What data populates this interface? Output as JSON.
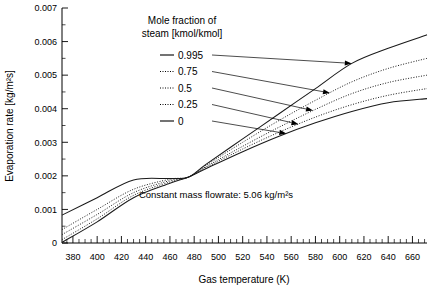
{
  "chart_data": {
    "type": "line",
    "title": "",
    "xlabel": "Gas temperature (K)",
    "ylabel": "Evaporation rate [kg/m²s]",
    "xlim": [
      371,
      672
    ],
    "ylim": [
      0,
      0.007
    ],
    "grid": false,
    "legend_position": "top-center-inside",
    "legend_title_line1": "Mole fraction of",
    "legend_title_line2": "steam [kmol/kmol]",
    "annotation": "Constant mass flowrate: 5.06 kg/m²s",
    "xticks": [
      380,
      400,
      420,
      440,
      460,
      480,
      500,
      520,
      540,
      560,
      580,
      600,
      620,
      640,
      660
    ],
    "xtick_labels": [
      "380",
      "400",
      "420",
      "440",
      "460",
      "480",
      "500",
      "520",
      "540",
      "560",
      "580",
      "600",
      "620",
      "640",
      "660"
    ],
    "xtick_minor_step": 5,
    "yticks": [
      0,
      0.001,
      0.002,
      0.003,
      0.004,
      0.005,
      0.006,
      0.007
    ],
    "ytick_labels": [
      "0",
      "0.001",
      "0.002",
      "0.003",
      "0.004",
      "0.005",
      "0.006",
      "0.007"
    ],
    "ytick_minor_step": 0.0005,
    "x": [
      371,
      400,
      430,
      460,
      475,
      490,
      520,
      550,
      580,
      610,
      640,
      672
    ],
    "series": [
      {
        "name": "0.995",
        "label": "0.995",
        "style": "solid",
        "color": "#1a1a1a",
        "values": [
          0.00083,
          0.00135,
          0.00188,
          0.00192,
          0.00196,
          0.00235,
          0.0031,
          0.00385,
          0.0046,
          0.00535,
          0.0058,
          0.0062
        ]
      },
      {
        "name": "0.75",
        "label": "0.75",
        "style": "dotted",
        "color": "#1a1a1a",
        "values": [
          0.0004,
          0.001,
          0.0016,
          0.0019,
          0.00196,
          0.00232,
          0.003,
          0.00365,
          0.00425,
          0.0048,
          0.0052,
          0.0055
        ]
      },
      {
        "name": "0.5",
        "label": "0.5",
        "style": "dotted",
        "color": "#1a1a1a",
        "values": [
          0.00025,
          0.00085,
          0.0015,
          0.00186,
          0.00196,
          0.00228,
          0.00288,
          0.00345,
          0.00398,
          0.00445,
          0.00478,
          0.005
        ]
      },
      {
        "name": "0.25",
        "label": "0.25",
        "style": "dotted",
        "color": "#1a1a1a",
        "values": [
          0.0001,
          0.00072,
          0.00142,
          0.00182,
          0.00196,
          0.00225,
          0.0028,
          0.0033,
          0.00375,
          0.00412,
          0.0044,
          0.0046
        ]
      },
      {
        "name": "0",
        "label": "0",
        "style": "solid",
        "color": "#1a1a1a",
        "values": [
          2e-05,
          0.00063,
          0.00135,
          0.00178,
          0.00196,
          0.00222,
          0.00272,
          0.00318,
          0.00358,
          0.00392,
          0.00418,
          0.0043
        ]
      }
    ]
  }
}
